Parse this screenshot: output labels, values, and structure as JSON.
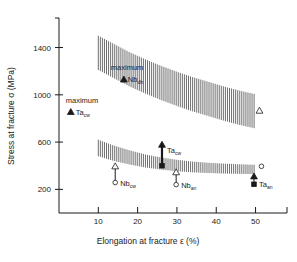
{
  "figure": {
    "background": "#ffffff",
    "ink_color": "#1a1a1a",
    "band_color": "#555555"
  },
  "chart_data": {
    "type": "scatter",
    "title": "",
    "xlabel": "Elongation at fracture ε (%)",
    "ylabel": "Stress at fracture σ (MPa)",
    "xlim": [
      0,
      58
    ],
    "ylim": [
      0,
      1650
    ],
    "grid": false,
    "legend": "none",
    "xticks": [
      10,
      20,
      30,
      40,
      50
    ],
    "xtick_labels": [
      "10",
      "20",
      "30",
      "40",
      "50"
    ],
    "yticks": [
      200,
      600,
      1000,
      1400
    ],
    "ytick_labels": [
      "200",
      "600",
      "1000",
      "1400"
    ],
    "bands": [
      {
        "name": "upper-hatched-band",
        "description": "hatched scatter band for drawn/hard material",
        "x": [
          10,
          14,
          18,
          22,
          26,
          30,
          34,
          38,
          42,
          46,
          50
        ],
        "upper": [
          1500,
          1430,
          1360,
          1300,
          1245,
          1195,
          1150,
          1110,
          1070,
          1035,
          1005
        ],
        "lower": [
          1210,
          1140,
          1070,
          1010,
          955,
          905,
          860,
          820,
          780,
          745,
          715
        ]
      },
      {
        "name": "lower-hatched-band",
        "description": "hatched scatter band for annealed / cold-worked material",
        "x": [
          10,
          14,
          18,
          22,
          26,
          30,
          34,
          38,
          42,
          46,
          50
        ],
        "upper": [
          620,
          570,
          530,
          495,
          470,
          450,
          435,
          425,
          418,
          412,
          408
        ],
        "lower": [
          480,
          440,
          410,
          385,
          367,
          353,
          344,
          338,
          334,
          331,
          330
        ]
      }
    ],
    "annotations": [
      {
        "name": "maximum-ta-cw",
        "label": "maximum",
        "symbol_label": "Ta",
        "symbol_sub": "cw",
        "marker": "filled-triangle",
        "x": 3.0,
        "y": 855
      },
      {
        "name": "maximum-nb-dh",
        "label": "maximum",
        "symbol_label": "Nb",
        "symbol_sub": "dh",
        "marker": "filled-triangle",
        "x": 16.5,
        "y": 1130
      },
      {
        "name": "nb-cw",
        "symbol_label": "Nb",
        "symbol_sub": "cw",
        "marker_top": "open-triangle",
        "marker_bottom": "open-circle",
        "x": 14.3,
        "y_top": 395,
        "y_bottom": 258
      },
      {
        "name": "ta-cw",
        "symbol_label": "Ta",
        "symbol_sub": "cw",
        "marker_top": "filled-triangle",
        "marker_bottom": "filled-square",
        "x": 26.2,
        "y_top": 578,
        "y_bottom": 400
      },
      {
        "name": "nb-an",
        "symbol_label": "Nb",
        "symbol_sub": "an",
        "marker_top": "open-triangle",
        "marker_bottom": "open-circle",
        "x": 29.8,
        "y_top": 345,
        "y_bottom": 240
      },
      {
        "name": "ta-an",
        "symbol_label": "Ta",
        "symbol_sub": "an",
        "marker_top": "filled-triangle",
        "marker_bottom": "filled-square",
        "x": 49.6,
        "y_top": 310,
        "y_bottom": 243
      },
      {
        "name": "open-circle-right",
        "marker": "open-circle",
        "x": 51.5,
        "y": 395
      },
      {
        "name": "open-triangle-right",
        "marker": "open-triangle",
        "x": 51.0,
        "y": 866
      }
    ]
  }
}
